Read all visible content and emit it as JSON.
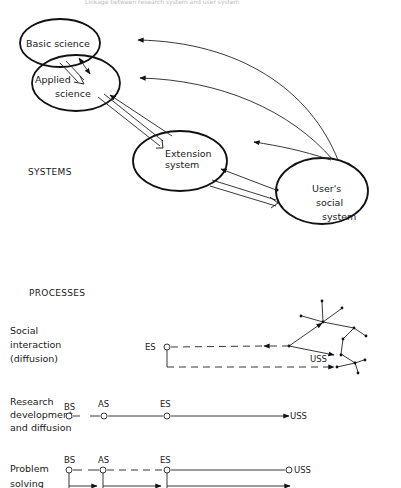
{
  "header": {
    "cut_off_caption": "Linkage between research system and user system"
  },
  "systems": {
    "section_label": "SYSTEMS",
    "basic_science": "Basic science",
    "applied_science_line1": "Applied",
    "applied_science_line2": "science",
    "extension_line1": "Extension",
    "extension_line2": "system",
    "user_line1": "User's",
    "user_line2": "social",
    "user_line3": "system"
  },
  "processes": {
    "section_label": "PROCESSES",
    "rows": [
      {
        "label_lines": [
          "Social",
          "interaction",
          "(diffusion)"
        ],
        "nodes": [
          "ES"
        ],
        "end": "USS"
      },
      {
        "label_lines": [
          "Research",
          "development",
          "and diffusion"
        ],
        "nodes": [
          "BS",
          "AS",
          "ES"
        ],
        "end": "USS"
      },
      {
        "label_lines": [
          "Problem",
          "solving"
        ],
        "nodes": [
          "BS",
          "AS",
          "ES"
        ],
        "end": "USS"
      }
    ]
  }
}
